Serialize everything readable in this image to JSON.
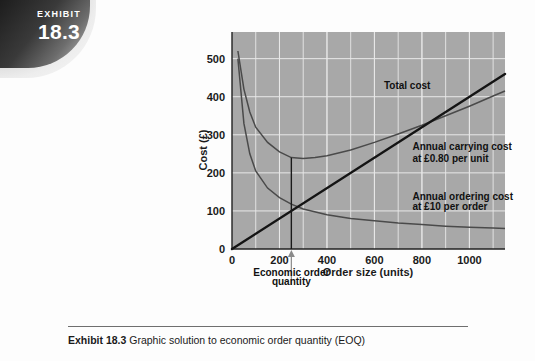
{
  "badge": {
    "label": "EXHIBIT",
    "number": "18.3"
  },
  "caption": {
    "prefix": "Exhibit 18.3",
    "text": "Graphic solution to economic order quantity (EOQ)"
  },
  "chart_data": {
    "type": "line",
    "title": "",
    "xlabel": "Order size (units)",
    "ylabel": "Cost (£)",
    "xlim": [
      0,
      1150
    ],
    "ylim": [
      0,
      570
    ],
    "xticks": [
      0,
      200,
      400,
      600,
      800,
      1000
    ],
    "yticks": [
      0,
      100,
      200,
      300,
      400,
      500
    ],
    "xtick_labels": [
      "0",
      "200",
      "400",
      "600",
      "800",
      "1000"
    ],
    "ytick_labels": [
      "0",
      "100",
      "200",
      "300",
      "400",
      "500"
    ],
    "grid": true,
    "plot_background": "#a8a8a8",
    "grid_color": "#e8e8e8",
    "legend_position": "inline-annotations",
    "series": [
      {
        "name": "Total cost",
        "color": "#4a4a4a",
        "style": "u-curve",
        "points": [
          [
            25,
            520
          ],
          [
            50,
            420
          ],
          [
            75,
            360
          ],
          [
            100,
            320
          ],
          [
            150,
            280
          ],
          [
            200,
            255
          ],
          [
            250,
            240
          ],
          [
            300,
            238
          ],
          [
            350,
            240
          ],
          [
            400,
            245
          ],
          [
            500,
            260
          ],
          [
            600,
            280
          ],
          [
            700,
            302
          ],
          [
            800,
            325
          ],
          [
            900,
            350
          ],
          [
            1000,
            375
          ],
          [
            1100,
            402
          ],
          [
            1150,
            415
          ]
        ]
      },
      {
        "name": "Annual carrying cost",
        "color": "#141414",
        "style": "straight-line",
        "rate": 0.4,
        "points": [
          [
            0,
            0
          ],
          [
            1150,
            460
          ]
        ]
      },
      {
        "name": "Annual ordering cost",
        "color": "#4a4a4a",
        "style": "hyperbola",
        "points": [
          [
            25,
            500
          ],
          [
            50,
            330
          ],
          [
            75,
            250
          ],
          [
            100,
            205
          ],
          [
            150,
            160
          ],
          [
            200,
            135
          ],
          [
            250,
            118
          ],
          [
            300,
            105
          ],
          [
            400,
            90
          ],
          [
            500,
            80
          ],
          [
            600,
            74
          ],
          [
            700,
            68
          ],
          [
            800,
            64
          ],
          [
            900,
            60
          ],
          [
            1000,
            57
          ],
          [
            1100,
            55
          ],
          [
            1150,
            54
          ]
        ]
      }
    ],
    "annotations": [
      {
        "name": "total-cost",
        "text": "Total cost",
        "x": 640,
        "y": 430
      },
      {
        "name": "carrying-cost-line1",
        "text": "Annual carrying cost",
        "x": 760,
        "y": 270
      },
      {
        "name": "carrying-cost-line2",
        "text": "at £0.80 per unit",
        "x": 760,
        "y": 240
      },
      {
        "name": "ordering-cost-line1",
        "text": "Annual ordering cost",
        "x": 760,
        "y": 140
      },
      {
        "name": "ordering-cost-line2",
        "text": "at £10 per order",
        "x": 760,
        "y": 112
      },
      {
        "name": "eoq-line1",
        "text": "Economic order",
        "x": 250,
        "y": -60
      },
      {
        "name": "eoq-line2",
        "text": "quantity",
        "x": 250,
        "y": -85
      }
    ],
    "markers": {
      "eoq_value": 250,
      "eoq_vertical_line_top": 240
    }
  }
}
